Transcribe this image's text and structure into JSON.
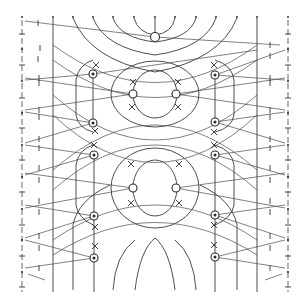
{
  "diagram": {
    "type": "line-pattern-chart",
    "colors": {
      "line": "#3a3a3a",
      "background": "#ffffff"
    },
    "top_dots_x": [
      22,
      53,
      73,
      93,
      113,
      134,
      155,
      175,
      196,
      216,
      237,
      257,
      288
    ],
    "edge_columns_x": [
      22,
      288
    ],
    "vertical_lines_x": [
      53,
      257
    ],
    "nodes": [
      {
        "id": "top-center",
        "x": 155,
        "y": 37
      },
      {
        "id": "left-1",
        "x": 93,
        "y": 74
      },
      {
        "id": "left-2",
        "x": 93,
        "y": 123
      },
      {
        "id": "left-3",
        "x": 94,
        "y": 155
      },
      {
        "id": "left-4",
        "x": 94,
        "y": 216
      },
      {
        "id": "left-5",
        "x": 94,
        "y": 258
      },
      {
        "id": "right-1",
        "x": 215,
        "y": 75
      },
      {
        "id": "right-2",
        "x": 215,
        "y": 122
      },
      {
        "id": "right-3",
        "x": 215,
        "y": 155
      },
      {
        "id": "right-4",
        "x": 215,
        "y": 215
      },
      {
        "id": "right-5",
        "x": 215,
        "y": 257
      },
      {
        "id": "center-upper-left",
        "x": 133,
        "y": 94
      },
      {
        "id": "center-upper-right",
        "x": 176,
        "y": 94
      },
      {
        "id": "center-lower-left",
        "x": 133,
        "y": 188
      },
      {
        "id": "center-lower-right",
        "x": 176,
        "y": 188
      }
    ],
    "cross_marks": [
      {
        "x": 96,
        "y": 65
      },
      {
        "x": 95,
        "y": 131
      },
      {
        "x": 94,
        "y": 145
      },
      {
        "x": 95,
        "y": 227
      },
      {
        "x": 95,
        "y": 246
      },
      {
        "x": 214,
        "y": 65
      },
      {
        "x": 214,
        "y": 132
      },
      {
        "x": 214,
        "y": 145
      },
      {
        "x": 214,
        "y": 225
      },
      {
        "x": 214,
        "y": 245
      },
      {
        "x": 133,
        "y": 82
      },
      {
        "x": 132,
        "y": 107
      },
      {
        "x": 178,
        "y": 82
      },
      {
        "x": 178,
        "y": 107
      },
      {
        "x": 131,
        "y": 164
      },
      {
        "x": 131,
        "y": 203
      },
      {
        "x": 179,
        "y": 164
      },
      {
        "x": 179,
        "y": 203
      }
    ]
  }
}
